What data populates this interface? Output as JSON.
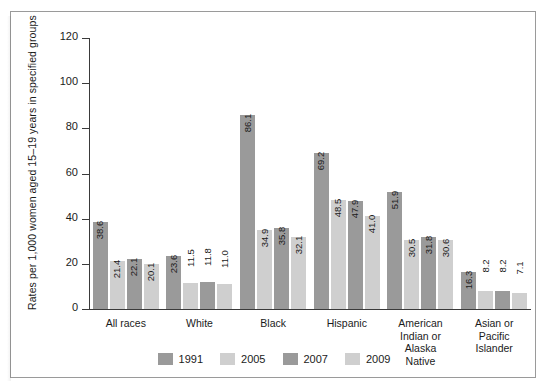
{
  "chart_data": {
    "type": "bar",
    "title": "",
    "xlabel": "",
    "ylabel": "Rates per 1,000 women aged 15–19 years in specified groups",
    "ylim": [
      0,
      120
    ],
    "yticks": [
      0,
      20,
      40,
      60,
      80,
      100,
      120
    ],
    "grid": false,
    "legend_position": "bottom",
    "categories": [
      "All races",
      "White",
      "Black",
      "Hispanic",
      "American\nIndian or\nAlaska\nNative",
      "Asian or\nPacific\nIslander"
    ],
    "series": [
      {
        "name": "1991",
        "color": "#9a9a9a",
        "values": [
          38.6,
          23.6,
          86.1,
          69.2,
          51.9,
          16.3
        ]
      },
      {
        "name": "2005",
        "color": "#cfcfcf",
        "values": [
          21.4,
          11.5,
          34.9,
          48.5,
          30.5,
          8.2
        ]
      },
      {
        "name": "2007",
        "color": "#9a9a9a",
        "values": [
          22.1,
          11.8,
          35.8,
          47.9,
          31.8,
          8.2
        ]
      },
      {
        "name": "2009",
        "color": "#cfcfcf",
        "values": [
          20.1,
          11.0,
          32.1,
          41.0,
          30.6,
          7.1
        ]
      }
    ],
    "value_labels": [
      [
        "38.6",
        "21.4",
        "22.1",
        "20.1"
      ],
      [
        "23.6",
        "11.5",
        "11.8",
        "11.0"
      ],
      [
        "86.1",
        "34.9",
        "35.8",
        "32.1"
      ],
      [
        "69.2",
        "48.5",
        "47.9",
        "41.0"
      ],
      [
        "51.9",
        "30.5",
        "31.8",
        "30.6"
      ],
      [
        "16.3",
        "8.2",
        "8.2",
        "7.1"
      ]
    ]
  },
  "legend": {
    "entries": [
      {
        "label": "1991",
        "color": "#9a9a9a"
      },
      {
        "label": "2005",
        "color": "#cfcfcf"
      },
      {
        "label": "2007",
        "color": "#9a9a9a"
      },
      {
        "label": "2009",
        "color": "#cfcfcf"
      }
    ]
  },
  "colors": {
    "axis": "#3a3a3a",
    "frame": "#9a9a9a",
    "text": "#1b1b1b",
    "background": "#ffffff",
    "bar_dark": "#9a9a9a",
    "bar_light": "#cfcfcf"
  }
}
